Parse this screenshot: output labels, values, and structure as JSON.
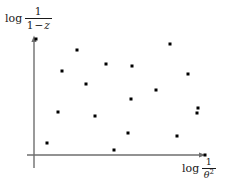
{
  "figure": {
    "background_color": "#ffffff",
    "axis_color": "#6e6e6e",
    "point_color": "#000000",
    "text_color": "#1a1a1a"
  },
  "labels": {
    "y_axis": {
      "operator": "log",
      "numerator": "1",
      "denominator_left": "1",
      "denominator_op": "−",
      "denominator_var": "z",
      "full_text": "log 1/(1 − z)"
    },
    "x_axis": {
      "operator": "log",
      "numerator": "1",
      "denominator_var": "θ",
      "denominator_exponent": "2",
      "full_text": "log 1/θ²"
    }
  },
  "axes": {
    "origin_x": 34,
    "origin_y": 155,
    "y_axis_top": 38,
    "y_axis_bottom": 168,
    "x_axis_right": 203,
    "arrow_y_tip_x": 34,
    "arrow_y_tip_y": 36,
    "arrow_x_tip_x": 205,
    "arrow_x_tip_y": 155
  },
  "chart_data": {
    "type": "scatter",
    "title": "",
    "xlabel": "log 1/θ²",
    "ylabel": "log 1/(1 − z)",
    "grid": false,
    "legend": null,
    "marker": {
      "shape": "square",
      "size_px": 3,
      "color": "#000000"
    },
    "axis_style": {
      "arrows": true,
      "ticks": false,
      "tick_labels": false,
      "spines": [
        "left",
        "bottom"
      ]
    },
    "xlim_px": [
      34,
      205
    ],
    "ylim_px": [
      155,
      36
    ],
    "n_points": 19,
    "points_px": [
      {
        "x": 77,
        "y": 50
      },
      {
        "x": 170,
        "y": 44
      },
      {
        "x": 106,
        "y": 64
      },
      {
        "x": 132,
        "y": 66
      },
      {
        "x": 62,
        "y": 71
      },
      {
        "x": 188,
        "y": 74
      },
      {
        "x": 86,
        "y": 84
      },
      {
        "x": 156,
        "y": 90
      },
      {
        "x": 131,
        "y": 99
      },
      {
        "x": 198,
        "y": 108
      },
      {
        "x": 58,
        "y": 112
      },
      {
        "x": 95,
        "y": 116
      },
      {
        "x": 197,
        "y": 113
      },
      {
        "x": 128,
        "y": 133
      },
      {
        "x": 177,
        "y": 136
      },
      {
        "x": 47,
        "y": 143
      },
      {
        "x": 114,
        "y": 150
      },
      {
        "x": 36,
        "y": 39
      },
      {
        "x": 205,
        "y": 155
      }
    ],
    "points_data": [
      {
        "x": 0.25,
        "y": 0.88
      },
      {
        "x": 0.8,
        "y": 0.93
      },
      {
        "x": 0.42,
        "y": 0.76
      },
      {
        "x": 0.57,
        "y": 0.75
      },
      {
        "x": 0.16,
        "y": 0.71
      },
      {
        "x": 0.9,
        "y": 0.68
      },
      {
        "x": 0.3,
        "y": 0.6
      },
      {
        "x": 0.71,
        "y": 0.55
      },
      {
        "x": 0.57,
        "y": 0.47
      },
      {
        "x": 0.96,
        "y": 0.39
      },
      {
        "x": 0.14,
        "y": 0.36
      },
      {
        "x": 0.36,
        "y": 0.33
      },
      {
        "x": 0.95,
        "y": 0.35
      },
      {
        "x": 0.55,
        "y": 0.18
      },
      {
        "x": 0.84,
        "y": 0.16
      },
      {
        "x": 0.08,
        "y": 0.1
      },
      {
        "x": 0.47,
        "y": 0.04
      }
    ]
  }
}
